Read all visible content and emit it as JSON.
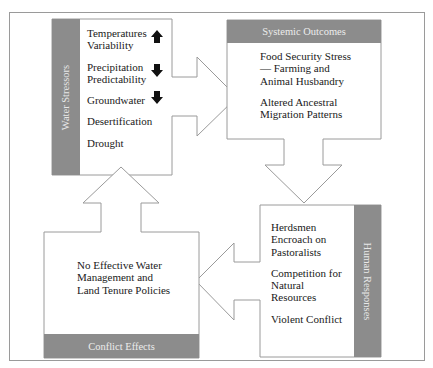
{
  "diagram": {
    "type": "cycle",
    "colors": {
      "header_fill": "#8c8c8c",
      "header_text": "#ececec",
      "outline": "#9a9a9a",
      "text": "#1a1a1a",
      "indicator": "#111111"
    },
    "water_stressors": {
      "title": "Water Stressors",
      "items": [
        {
          "line1": "Temperatures",
          "line2": "Variability",
          "trend": "up"
        },
        {
          "line1": "Precipitation",
          "line2": "Predictability",
          "trend": "down"
        },
        {
          "line1": "Groundwater",
          "trend": "down"
        },
        {
          "line1": "Desertification"
        },
        {
          "line1": "Drought"
        }
      ]
    },
    "systemic_outcomes": {
      "title": "Systemic Outcomes",
      "items": [
        {
          "lines": [
            "Food Security Stress",
            "— Farming and",
            "Animal Husbandry"
          ]
        },
        {
          "lines": [
            "Altered Ancestral",
            "Migration Patterns"
          ]
        }
      ]
    },
    "human_responses": {
      "title": "Human Responses",
      "items": [
        {
          "lines": [
            "Herdsmen",
            "Encroach on",
            "Pastoralists"
          ]
        },
        {
          "lines": [
            "Competition for",
            "Natural",
            "Resources"
          ]
        },
        {
          "lines": [
            "Violent Conflict"
          ]
        }
      ]
    },
    "conflict_effects": {
      "title": "Conflict Effects",
      "items": [
        {
          "lines": [
            "No Effective Water",
            "Management and",
            "Land Tenure Policies"
          ]
        }
      ]
    },
    "flow": [
      {
        "from": "Water Stressors",
        "to": "Systemic Outcomes",
        "direction": "right"
      },
      {
        "from": "Systemic Outcomes",
        "to": "Human Responses",
        "direction": "down"
      },
      {
        "from": "Human Responses",
        "to": "Conflict Effects",
        "direction": "left"
      },
      {
        "from": "Conflict Effects",
        "to": "Water Stressors",
        "direction": "up"
      }
    ]
  }
}
